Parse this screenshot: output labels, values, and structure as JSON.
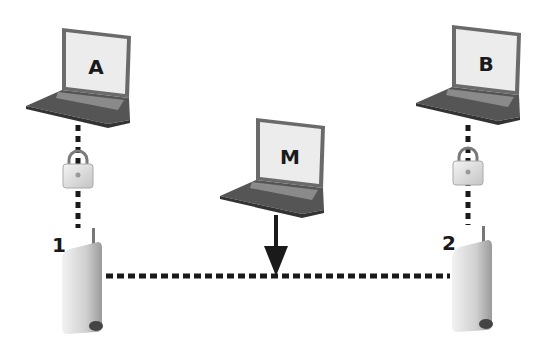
{
  "diagram": {
    "type": "man-in-the-middle network diagram",
    "nodes": {
      "laptop_a": {
        "label": "A"
      },
      "laptop_b": {
        "label": "B"
      },
      "laptop_m": {
        "label": "M"
      },
      "router_1": {
        "label": "1"
      },
      "router_2": {
        "label": "2"
      }
    },
    "connections": [
      {
        "from": "A",
        "to": "1",
        "style": "dotted",
        "secured": true
      },
      {
        "from": "B",
        "to": "2",
        "style": "dotted",
        "secured": true
      },
      {
        "from": "1",
        "to": "2",
        "style": "dotted",
        "secured": false
      },
      {
        "from": "M",
        "to": "1-2 link",
        "style": "arrow"
      }
    ]
  },
  "colors": {
    "line": "#1a1a1a",
    "laptop_body": "#5a5a5a",
    "screen": "#eeeeee",
    "router": "#d8d8d8"
  }
}
